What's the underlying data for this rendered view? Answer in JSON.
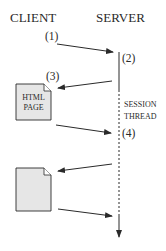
{
  "headers": {
    "client": "CLIENT",
    "server": "SERVER"
  },
  "steps": {
    "s1": "(1)",
    "s2": "(2)",
    "s3": "(3)",
    "s4": "(4)"
  },
  "documents": {
    "html_page": {
      "line1": "HTML",
      "line2": "PAGE"
    }
  },
  "server_thread": {
    "line1": "SESSION",
    "line2": "THREAD"
  },
  "colors": {
    "ink": "#2a2a2a",
    "doc_fill": "#e6e6e6"
  }
}
